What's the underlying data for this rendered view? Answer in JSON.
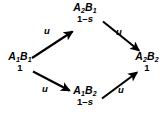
{
  "diagram": {
    "background_color": "#ffffff",
    "stroke_color": "#000000",
    "text_color": "#000000",
    "nodes": [
      {
        "id": "A1B1",
        "genotype_a": "A",
        "genotype_a_sub": "1",
        "genotype_b": "B",
        "genotype_b_sub": "1",
        "fitness": "1",
        "position": "left"
      },
      {
        "id": "A2B1",
        "genotype_a": "A",
        "genotype_a_sub": "2",
        "genotype_b": "B",
        "genotype_b_sub": "1",
        "fitness_prefix": "1–",
        "fitness_symbol": "s",
        "position": "top"
      },
      {
        "id": "A1B2",
        "genotype_a": "A",
        "genotype_a_sub": "1",
        "genotype_b": "B",
        "genotype_b_sub": "2",
        "fitness_prefix": "1–",
        "fitness_symbol": "s",
        "position": "bottom"
      },
      {
        "id": "A2B2",
        "genotype_a": "A",
        "genotype_a_sub": "2",
        "genotype_b": "B",
        "genotype_b_sub": "2",
        "fitness": "1",
        "position": "right"
      }
    ],
    "edges": [
      {
        "id": "a1b1-to-a2b1",
        "from": "A1B1",
        "to": "A2B1",
        "label": "u",
        "direction": "up-right"
      },
      {
        "id": "a2b1-to-a2b2",
        "from": "A2B1",
        "to": "A2B2",
        "label": "u",
        "direction": "down-right"
      },
      {
        "id": "a1b1-to-a1b2",
        "from": "A1B1",
        "to": "A1B2",
        "label": "u",
        "direction": "down-right"
      },
      {
        "id": "a1b2-to-a2b2",
        "from": "A1B2",
        "to": "A2B2",
        "label": "u",
        "direction": "up-right"
      }
    ]
  }
}
